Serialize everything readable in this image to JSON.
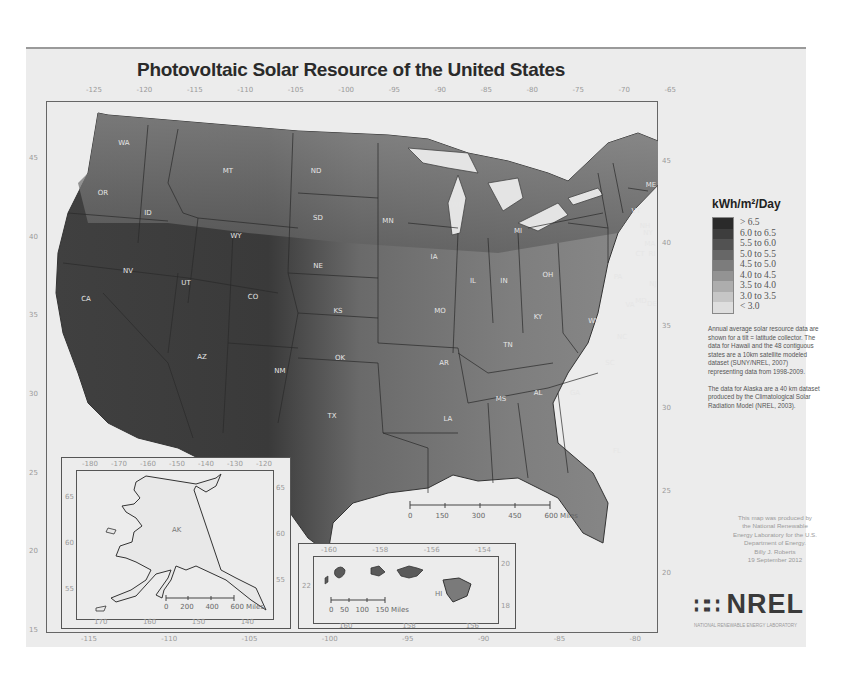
{
  "map": {
    "title": "Photovoltaic Solar Resource of the United States",
    "top_longitudes": [
      "-125",
      "-120",
      "-115",
      "-110",
      "-105",
      "-100",
      "-95",
      "-90",
      "-85",
      "-80",
      "-75",
      "-70",
      "-65"
    ],
    "bottom_longitudes": [
      "-115",
      "-110",
      "-105",
      "-100",
      "-95",
      "-90",
      "-85",
      "-80"
    ],
    "left_latitudes": [
      "45",
      "40",
      "35",
      "30",
      "25",
      "20",
      "15"
    ],
    "right_latitudes": [
      "45",
      "40",
      "35",
      "30",
      "25",
      "20"
    ],
    "states": [
      "WA",
      "OR",
      "CA",
      "ID",
      "NV",
      "MT",
      "WY",
      "UT",
      "AZ",
      "CO",
      "NM",
      "ND",
      "SD",
      "NE",
      "KS",
      "OK",
      "TX",
      "MN",
      "IA",
      "MO",
      "AR",
      "LA",
      "WI",
      "IL",
      "MI",
      "IN",
      "OH",
      "KY",
      "TN",
      "MS",
      "AL",
      "GA",
      "FL",
      "SC",
      "NC",
      "VA",
      "WV",
      "PA",
      "NY",
      "MD",
      "DE",
      "NJ",
      "VT",
      "NH",
      "ME",
      "MA",
      "CT",
      "RI"
    ],
    "scale_bar": {
      "ticks": [
        "0",
        "150",
        "300",
        "450",
        "600 Miles"
      ]
    }
  },
  "legend": {
    "title": "kWh/m²/Day",
    "items": [
      {
        "label": "> 6.5",
        "color": "#2a2a2a"
      },
      {
        "label": "6.0 to 6.5",
        "color": "#3d3d3d"
      },
      {
        "label": "5.5 to 6.0",
        "color": "#525252"
      },
      {
        "label": "5.0 to 5.5",
        "color": "#676767"
      },
      {
        "label": "4.5 to 5.0",
        "color": "#7c7c7c"
      },
      {
        "label": "4.0 to 4.5",
        "color": "#939393"
      },
      {
        "label": "3.5 to 4.0",
        "color": "#adadad"
      },
      {
        "label": "3.0 to 3.5",
        "color": "#c6c6c6"
      },
      {
        "label": "< 3.0",
        "color": "#dedede"
      }
    ]
  },
  "notes": {
    "paragraph1": "Annual average solar resource data are shown for a tilt = latitude collector. The data for Hawaii and the 48 contiguous states are a 10km satellite modeled dataset (SUNY/NREL, 2007) representing data from 1998-2009.",
    "paragraph2": "The data for Alaska are a 40 km dataset produced by the Climatological Solar Radiation Model (NREL, 2003)."
  },
  "credit": {
    "lines": [
      "This map was produced by",
      "the National Renewable",
      "Energy Laboratory for the U.S.",
      "Department of Energy.",
      "Billy J. Roberts",
      "19 September 2012"
    ]
  },
  "logo": {
    "text": "NREL",
    "subtitle": "NATIONAL RENEWABLE ENERGY LABORATORY"
  },
  "alaska_inset": {
    "label": "AK",
    "top_longitudes": [
      "-180",
      "-170",
      "-160",
      "-150",
      "-140",
      "-130",
      "-120"
    ],
    "bottom_longitudes": [
      "170",
      "160",
      "150",
      "140"
    ],
    "left_latitudes": [
      "65",
      "60",
      "55"
    ],
    "right_latitudes": [
      "65",
      "60",
      "55"
    ],
    "scale_ticks": [
      "0",
      "200",
      "400",
      "600 Miles"
    ]
  },
  "hawaii_inset": {
    "label": "HI",
    "top_longitudes": [
      "-160",
      "-158",
      "-156",
      "-154"
    ],
    "bottom_longitudes": [
      "160",
      "158",
      "156"
    ],
    "left_latitudes": [
      "22"
    ],
    "right_latitudes": [
      "20",
      "18"
    ],
    "scale_ticks": [
      "0",
      "50",
      "100",
      "150 Miles"
    ]
  }
}
